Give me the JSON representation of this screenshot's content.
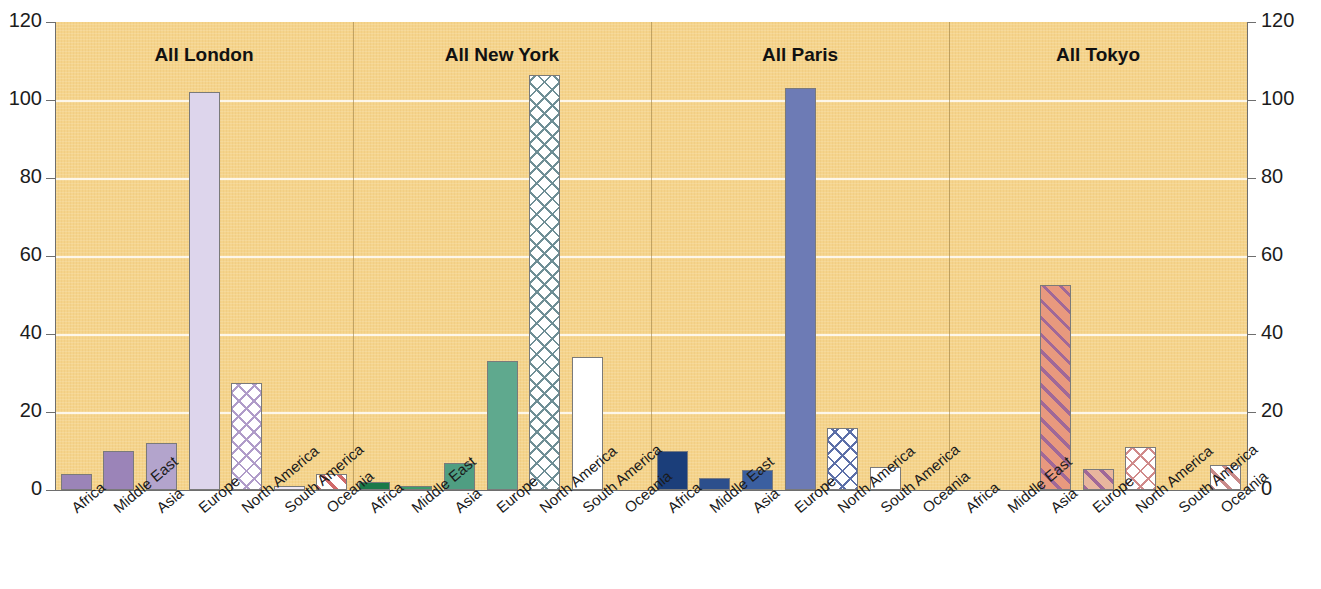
{
  "chart_data": {
    "type": "bar",
    "title": "",
    "xlabel": "",
    "ylabel": "",
    "ylim": [
      0,
      120
    ],
    "ytick_values": [
      0,
      20,
      40,
      60,
      80,
      100,
      120
    ],
    "ytick_labels": [
      "0",
      "20",
      "40",
      "60",
      "80",
      "100",
      "120"
    ],
    "right_axis_labels": [
      "0",
      "20",
      "40",
      "60",
      "80",
      "100",
      "120"
    ],
    "grid": true,
    "legend": "none",
    "categories": [
      "Africa",
      "Middle East",
      "Asia",
      "Europe",
      "North America",
      "South America",
      "Oceania"
    ],
    "panels": [
      {
        "title": "All London",
        "values": [
          4,
          10,
          12,
          102,
          27.5,
          1,
          4
        ],
        "bar_styles": [
          "solid",
          "solid",
          "solid",
          "solid",
          "crosshatch",
          "solid",
          "diagonal"
        ],
        "colors": [
          "#9b84b8",
          "#9b84b8",
          "#b3a4cc",
          "#ddd5ec",
          "#ffffff",
          "#efe9f5",
          "#ffffff"
        ],
        "hatch_colors": [
          "",
          "",
          "",
          "",
          "#b09cc9",
          "",
          "#d06a6a"
        ]
      },
      {
        "title": "All New York",
        "values": [
          2,
          1,
          7,
          33,
          106.5,
          34,
          0
        ],
        "bar_styles": [
          "solid",
          "solid",
          "solid",
          "solid",
          "crosshatch",
          "solid",
          "none"
        ],
        "colors": [
          "#1b7a4a",
          "#3d9a6b",
          "#4f9e82",
          "#5fa98e",
          "#ffffff",
          "#ffffff",
          ""
        ],
        "hatch_colors": [
          "",
          "",
          "",
          "",
          "#6f8f96",
          "",
          ""
        ]
      },
      {
        "title": "All Paris",
        "values": [
          10,
          3,
          5,
          103,
          16,
          6,
          0
        ],
        "bar_styles": [
          "solid",
          "solid",
          "solid",
          "solid",
          "crosshatch",
          "solid",
          "none"
        ],
        "colors": [
          "#1b3e7a",
          "#2c4f8c",
          "#3b5fa0",
          "#6d7bb5",
          "#ffffff",
          "#ffffff",
          ""
        ],
        "hatch_colors": [
          "",
          "",
          "",
          "",
          "#5c6fa8",
          "",
          ""
        ]
      },
      {
        "title": "All Tokyo",
        "values": [
          0,
          0,
          52.5,
          5.5,
          11,
          0,
          6.5
        ],
        "bar_styles": [
          "none",
          "none",
          "diagonal",
          "diagonal",
          "crosshatch",
          "none",
          "diagonal"
        ],
        "colors": [
          "",
          "",
          "#e8997e",
          "#e8b69e",
          "#ffffff",
          "",
          "#ffffff"
        ],
        "hatch_colors": [
          "",
          "",
          "#a06898",
          "#a06898",
          "#d08a8a",
          "",
          "#c98a8a"
        ]
      }
    ]
  },
  "style": {
    "plot_background": "#f5d48c",
    "gridline_color": "#ffffff",
    "axis_color": "#6e6e6e",
    "text_color": "#1c1c1c"
  }
}
